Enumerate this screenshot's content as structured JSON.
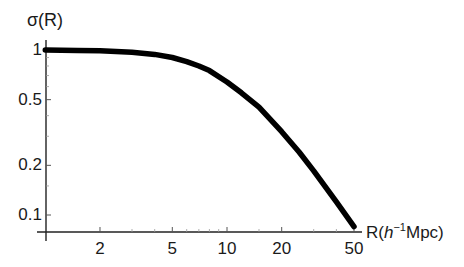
{
  "chart_data": {
    "type": "line",
    "title": "",
    "xlabel": "R(h⁻¹Mpc)",
    "xlabel_parts": {
      "pre": "R(",
      "italic": "h",
      "sup": "−1",
      "post": "Mpc)"
    },
    "ylabel": "σ(R)",
    "xscale": "log",
    "yscale": "log",
    "xlim": [
      1,
      50
    ],
    "ylim": [
      0.079,
      1.07
    ],
    "grid": false,
    "legend": null,
    "x_ticks": [
      {
        "value": 2,
        "label": "2"
      },
      {
        "value": 5,
        "label": "5"
      },
      {
        "value": 10,
        "label": "10"
      },
      {
        "value": 20,
        "label": "20"
      },
      {
        "value": 50,
        "label": "50"
      }
    ],
    "y_ticks": [
      {
        "value": 1,
        "label": "1"
      },
      {
        "value": 0.5,
        "label": "0.5"
      },
      {
        "value": 0.2,
        "label": "0.2"
      },
      {
        "value": 0.1,
        "label": "0.1"
      }
    ],
    "series": [
      {
        "name": "sigma(R)",
        "color": "#000000",
        "x": [
          1,
          1.5,
          2,
          3,
          4,
          5,
          6,
          7,
          8,
          10,
          12,
          15,
          20,
          25,
          30,
          40,
          50
        ],
        "y": [
          1.0,
          0.995,
          0.99,
          0.97,
          0.94,
          0.9,
          0.85,
          0.8,
          0.75,
          0.64,
          0.55,
          0.45,
          0.32,
          0.24,
          0.185,
          0.12,
          0.085
        ]
      }
    ]
  }
}
